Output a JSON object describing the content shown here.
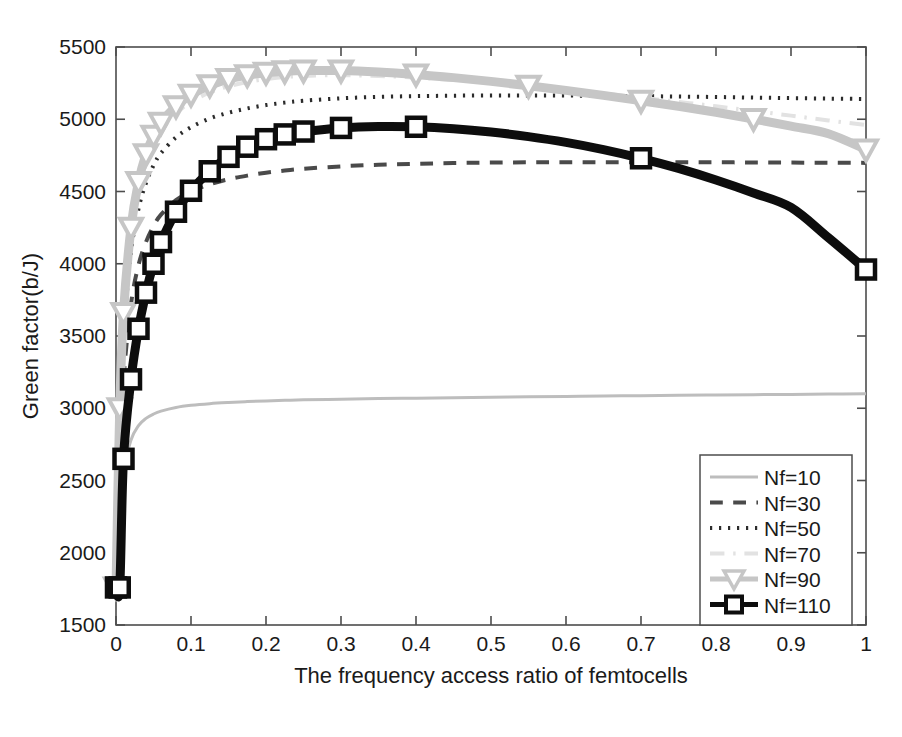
{
  "chart_data": {
    "type": "line",
    "title": "",
    "xlabel": "The frequency access ratio of femtocells",
    "ylabel": "Green factor(b/J)",
    "xlim": [
      0,
      1
    ],
    "ylim": [
      1500,
      5500
    ],
    "xticks": [
      "0",
      "0.1",
      "0.2",
      "0.3",
      "0.4",
      "0.5",
      "0.6",
      "0.7",
      "0.8",
      "0.9",
      "1"
    ],
    "xtick_values": [
      0,
      0.1,
      0.2,
      0.3,
      0.4,
      0.5,
      0.6,
      0.7,
      0.8,
      0.9,
      1
    ],
    "yticks": [
      "1500",
      "2000",
      "2500",
      "3000",
      "3500",
      "4000",
      "4500",
      "5000",
      "5500"
    ],
    "ytick_values": [
      1500,
      2000,
      2500,
      3000,
      3500,
      4000,
      4500,
      5000,
      5500
    ],
    "grid": false,
    "legend_position": "lower right",
    "x": [
      0,
      0.005,
      0.01,
      0.02,
      0.03,
      0.04,
      0.05,
      0.06,
      0.08,
      0.1,
      0.125,
      0.15,
      0.175,
      0.2,
      0.225,
      0.25,
      0.3,
      0.35,
      0.4,
      0.45,
      0.5,
      0.55,
      0.6,
      0.65,
      0.7,
      0.75,
      0.8,
      0.85,
      0.9,
      0.95,
      1
    ],
    "series": [
      {
        "name": "Nf=10",
        "color": "#bdbdbd",
        "style": "solid",
        "marker": "none",
        "width": 3,
        "values": [
          1760,
          2300,
          2560,
          2780,
          2880,
          2930,
          2960,
          2980,
          3005,
          3020,
          3032,
          3040,
          3046,
          3051,
          3055,
          3058,
          3063,
          3067,
          3070,
          3073,
          3076,
          3079,
          3082,
          3085,
          3087,
          3090,
          3092,
          3094,
          3096,
          3098,
          3100
        ]
      },
      {
        "name": "Nf=30",
        "color": "#4a4a4a",
        "style": "dashed",
        "marker": "none",
        "width": 4,
        "values": [
          1760,
          2680,
          3200,
          3720,
          3990,
          4150,
          4260,
          4340,
          4440,
          4500,
          4550,
          4585,
          4610,
          4630,
          4645,
          4657,
          4674,
          4685,
          4692,
          4697,
          4700,
          4702,
          4703,
          4703,
          4703,
          4702,
          4702,
          4701,
          4700,
          4699,
          4698
        ]
      },
      {
        "name": "Nf=50",
        "color": "#2b2b2b",
        "style": "dotted",
        "marker": "none",
        "width": 4,
        "values": [
          1760,
          2900,
          3500,
          4080,
          4380,
          4560,
          4680,
          4765,
          4875,
          4945,
          5005,
          5045,
          5075,
          5098,
          5115,
          5128,
          5145,
          5155,
          5160,
          5163,
          5165,
          5165,
          5164,
          5162,
          5160,
          5157,
          5154,
          5150,
          5146,
          5143,
          5140
        ]
      },
      {
        "name": "Nf=70",
        "color": "#e2e2e2",
        "style": "dashdot",
        "marker": "none",
        "width": 4,
        "values": [
          1760,
          2980,
          3620,
          4210,
          4520,
          4710,
          4835,
          4925,
          5040,
          5120,
          5185,
          5228,
          5258,
          5278,
          5292,
          5300,
          5305,
          5300,
          5288,
          5272,
          5252,
          5230,
          5205,
          5178,
          5150,
          5120,
          5090,
          5058,
          5025,
          4992,
          4960
        ]
      },
      {
        "name": "Nf=90",
        "color": "#c6c6c6",
        "style": "solid",
        "marker": "triangle-down",
        "width": 9,
        "values": [
          1760,
          3000,
          3660,
          4250,
          4565,
          4758,
          4885,
          4975,
          5090,
          5170,
          5235,
          5278,
          5305,
          5322,
          5332,
          5337,
          5337,
          5327,
          5310,
          5288,
          5262,
          5232,
          5200,
          5165,
          5128,
          5090,
          5048,
          5002,
          4952,
          4900,
          4790
        ]
      },
      {
        "name": "Nf=110",
        "color": "#0d0d0d",
        "style": "solid",
        "marker": "square",
        "width": 9,
        "values": [
          1760,
          1760,
          2650,
          3200,
          3550,
          3800,
          4000,
          4150,
          4360,
          4505,
          4640,
          4740,
          4810,
          4862,
          4895,
          4915,
          4940,
          4950,
          4948,
          4935,
          4912,
          4880,
          4840,
          4790,
          4730,
          4660,
          4580,
          4490,
          4390,
          4180,
          3960
        ]
      }
    ]
  },
  "legend": {
    "entries": [
      {
        "label": "Nf=10"
      },
      {
        "label": "Nf=30"
      },
      {
        "label": "Nf=50"
      },
      {
        "label": "Nf=70"
      },
      {
        "label": "Nf=90"
      },
      {
        "label": "Nf=110"
      }
    ]
  }
}
